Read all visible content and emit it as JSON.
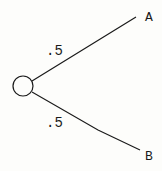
{
  "diagram": {
    "type": "probability-tree",
    "colors": {
      "stroke": "#1a1a1a",
      "background": "#fdfdfb"
    },
    "root": {
      "shape": "circle",
      "label": ""
    },
    "branches": [
      {
        "probability": ".5",
        "outcome": "A"
      },
      {
        "probability": ".5",
        "outcome": "B"
      }
    ]
  }
}
